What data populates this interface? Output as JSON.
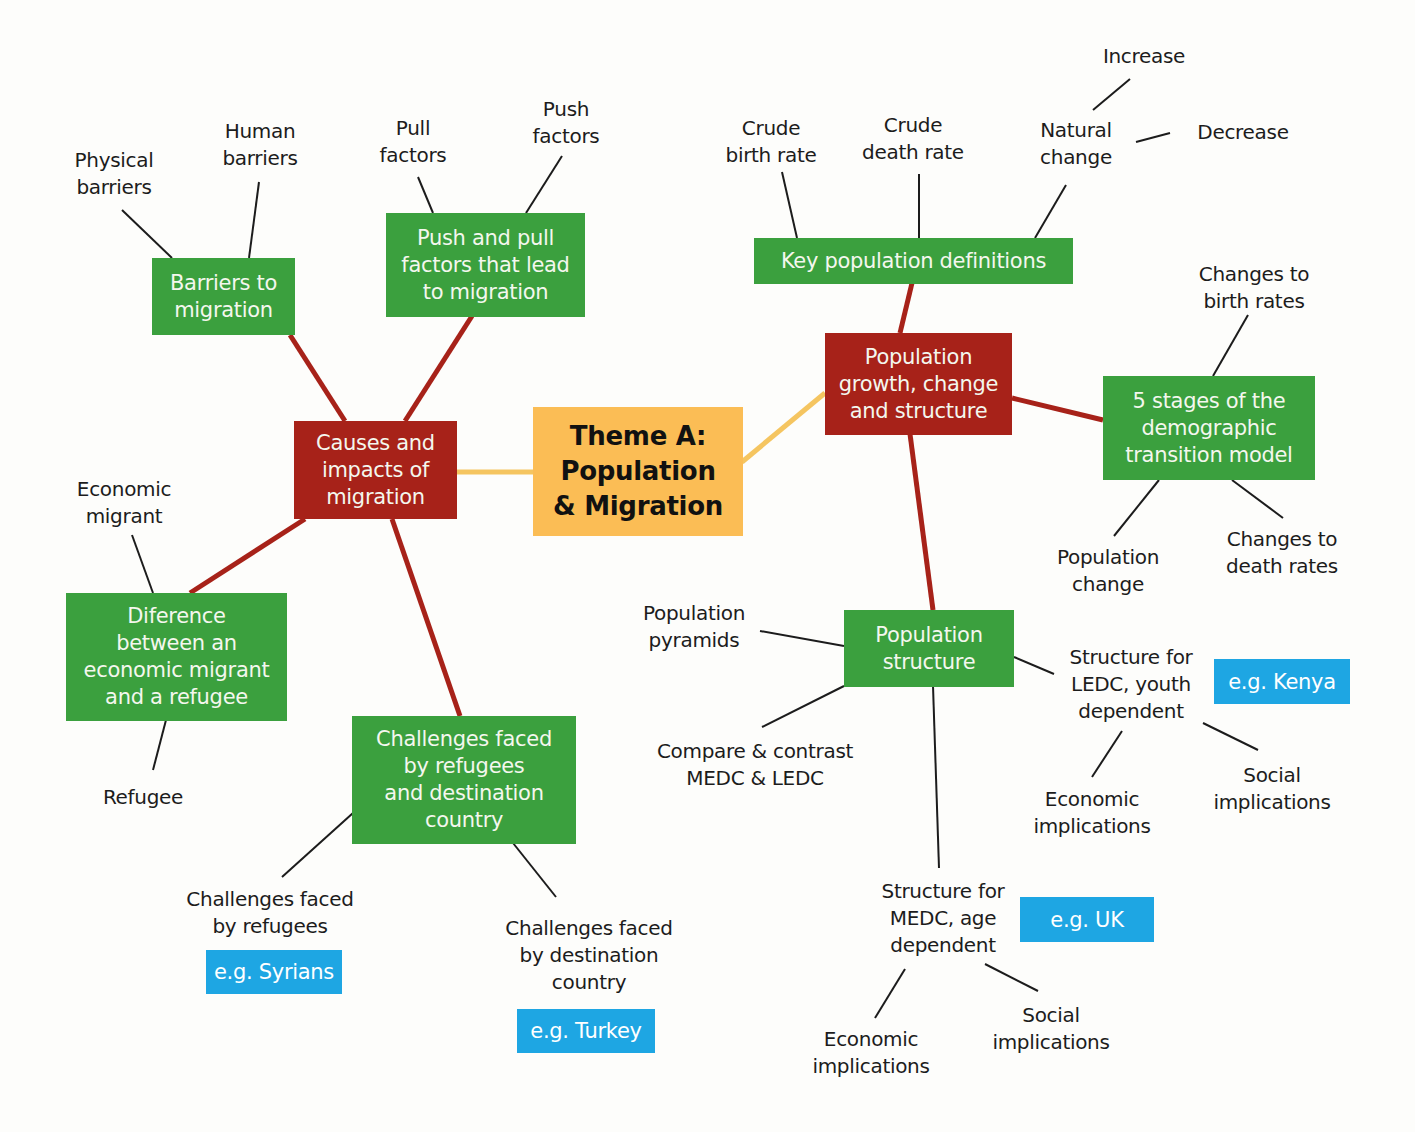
{
  "colors": {
    "center": "#fbbd55",
    "primary_branch": "#a72219",
    "secondary_node": "#3ba03e",
    "example_tag": "#1ea6e3",
    "center_connector": "#f5c560",
    "leaf_line": "#1c1c1c"
  },
  "center": {
    "text": "Theme A:\nPopulation\n& Migration"
  },
  "branches": {
    "migration": {
      "text": "Causes and\nimpacts of\nmigration",
      "children": {
        "barriers": {
          "text": "Barriers to\nmigration",
          "leaves": [
            "Physical\nbarriers",
            "Human\nbarriers"
          ]
        },
        "push_pull": {
          "text": "Push and pull\nfactors that lead\nto migration",
          "leaves": [
            "Pull\nfactors",
            "Push\nfactors"
          ]
        },
        "difference": {
          "text": "Diference\nbetween an\neconomic migrant\nand a refugee",
          "leaves": [
            "Economic\nmigrant",
            "Refugee"
          ]
        },
        "challenges": {
          "text": "Challenges faced\nby refugees\nand destination\ncountry",
          "leaves": [
            "Challenges faced\nby refugees",
            "Challenges faced\nby destination\ncountry"
          ],
          "examples": [
            "e.g. Syrians",
            "e.g. Turkey"
          ]
        }
      }
    },
    "population": {
      "text": "Population\ngrowth, change\nand structure",
      "children": {
        "definitions": {
          "text": "Key population definitions",
          "leaves": [
            "Crude\nbirth rate",
            "Crude\ndeath rate",
            "Natural\nchange"
          ],
          "natural_change_leaves": [
            "Increase",
            "Decrease"
          ]
        },
        "dtm": {
          "text": "5 stages of the\ndemographic\ntransition model",
          "leaves": [
            "Changes to\nbirth rates",
            "Population\nchange",
            "Changes to\ndeath rates"
          ]
        },
        "structure": {
          "text": "Population\nstructure",
          "leaves": [
            "Population\npyramids",
            "Compare & contrast\nMEDC & LEDC"
          ],
          "ledc": {
            "text": "Structure for\nLEDC, youth\ndependent",
            "example": "e.g. Kenya",
            "leaves": [
              "Economic\nimplications",
              "Social\nimplications"
            ]
          },
          "medc": {
            "text": "Structure for\nMEDC, age\ndependent",
            "example": "e.g. UK",
            "leaves": [
              "Economic\nimplications",
              "Social\nimplications"
            ]
          }
        }
      }
    }
  }
}
